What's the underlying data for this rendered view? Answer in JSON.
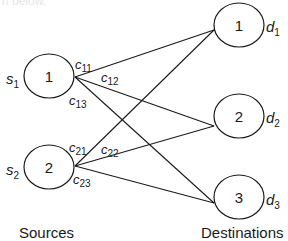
{
  "diagram": {
    "type": "bipartite-transportation-network",
    "caption_fragment": "n below.",
    "sources": [
      {
        "id": "1",
        "label": "s",
        "sub": "1",
        "cx": 49,
        "cy": 76
      },
      {
        "id": "2",
        "label": "s",
        "sub": "2",
        "cx": 49,
        "cy": 167
      }
    ],
    "destinations": [
      {
        "id": "1",
        "label": "d",
        "sub": "1",
        "cx": 239,
        "cy": 25
      },
      {
        "id": "2",
        "label": "d",
        "sub": "2",
        "cx": 239,
        "cy": 116
      },
      {
        "id": "3",
        "label": "d",
        "sub": "3",
        "cx": 239,
        "cy": 197
      }
    ],
    "edges": [
      {
        "from": "s1",
        "to": "d1",
        "cost_label": "c",
        "cost_sub": "11"
      },
      {
        "from": "s1",
        "to": "d2",
        "cost_label": "c",
        "cost_sub": "12"
      },
      {
        "from": "s1",
        "to": "d3",
        "cost_label": "c",
        "cost_sub": "13"
      },
      {
        "from": "s2",
        "to": "d1",
        "cost_label": "c",
        "cost_sub": "21"
      },
      {
        "from": "s2",
        "to": "d2",
        "cost_label": "c",
        "cost_sub": "22"
      },
      {
        "from": "s2",
        "to": "d3",
        "cost_label": "c",
        "cost_sub": "23"
      }
    ],
    "group_labels": {
      "sources": "Sources",
      "destinations": "Destinations"
    },
    "colors": {
      "stroke": "#1a1a1a",
      "background": "#ffffff"
    }
  }
}
